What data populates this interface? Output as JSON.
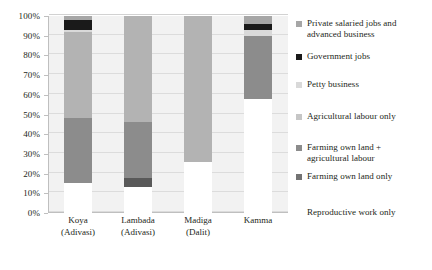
{
  "chart_data": {
    "type": "bar",
    "subtype": "stacked-percentage",
    "title": "",
    "xlabel": "",
    "ylabel": "",
    "ylim": [
      0,
      100
    ],
    "ytick_labels": [
      "0%",
      "10%",
      "20%",
      "30%",
      "40%",
      "50%",
      "60%",
      "70%",
      "80%",
      "90%",
      "100%"
    ],
    "ytick_values": [
      0,
      10,
      20,
      30,
      40,
      50,
      60,
      70,
      80,
      90,
      100
    ],
    "grid": true,
    "legend_position": "right",
    "categories": [
      "Koya (Adivasi)",
      "Lambada (Adivasi)",
      "Madiga (Dalit)",
      "Kamma"
    ],
    "category_lines": [
      [
        "Koya",
        "(Adivasi)"
      ],
      [
        "Lambada",
        "(Adivasi)"
      ],
      [
        "Madiga",
        "(Dalit)"
      ],
      [
        "Kamma",
        ""
      ]
    ],
    "series": [
      {
        "name": "Private salaried jobs and advanced business",
        "color": "#a6a6a6",
        "values": [
          2,
          0,
          0,
          4
        ]
      },
      {
        "name": "Government jobs",
        "color": "#1a1a1a",
        "values": [
          5,
          0,
          0,
          3
        ]
      },
      {
        "name": "Petty business",
        "color": "#d9d9d9",
        "values": [
          1,
          0,
          0,
          3
        ]
      },
      {
        "name": "Agricultural labour only",
        "color": "#b3b3b3",
        "values": [
          44,
          54,
          74,
          0
        ]
      },
      {
        "name": "Farming own land + agricultural labour",
        "color": "#8c8c8c",
        "values": [
          33,
          28,
          0,
          32
        ]
      },
      {
        "name": "Farming own land only",
        "color": "#595959",
        "values": [
          0,
          5,
          0,
          0
        ]
      },
      {
        "name": "Reproductive work only",
        "color": "#ffffff",
        "values": [
          15,
          13,
          26,
          58
        ]
      }
    ],
    "stack_order_top_to_bottom": [
      "Private salaried jobs and advanced business",
      "Government jobs",
      "Petty business",
      "Agricultural labour only",
      "Farming own land + agricultural labour",
      "Farming own land only",
      "Reproductive work only"
    ]
  },
  "legend": {
    "entries": [
      {
        "label_line1": "Private salaried jobs and",
        "label_line2": "advanced business",
        "swatch": "#a6a6a6",
        "has_swatch": true
      },
      {
        "label_line1": "Government jobs",
        "label_line2": "",
        "swatch": "#1a1a1a",
        "has_swatch": true
      },
      {
        "label_line1": "Petty business",
        "label_line2": "",
        "swatch": "#d9d9d9",
        "has_swatch": true
      },
      {
        "label_line1": "Agricultural labour only",
        "label_line2": "",
        "swatch": "#c6c6c6",
        "has_swatch": true
      },
      {
        "label_line1": "Farming own land +",
        "label_line2": "agricultural labour",
        "swatch": "#8c8c8c",
        "has_swatch": true
      },
      {
        "label_line1": "Farming own land only",
        "label_line2": "",
        "swatch": "#737373",
        "has_swatch": true
      },
      {
        "label_line1": "Reproductive work only",
        "label_line2": "",
        "swatch": "#ffffff",
        "has_swatch": false
      }
    ]
  },
  "style": {
    "plot_background": "#f2f2f2",
    "gridline_color": "#dcdcdc",
    "axis_color": "#bfbfbf",
    "text_color": "#231f20"
  }
}
